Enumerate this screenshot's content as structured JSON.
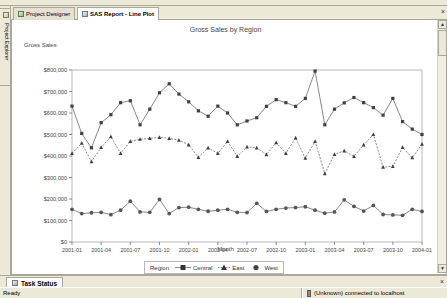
{
  "window": {
    "toolbar_hint": "Project Designer toolbar",
    "close_label": "×"
  },
  "left_dock": {
    "label": "Project Explorer",
    "icon": "project-explorer-icon"
  },
  "tabs": [
    {
      "label": "Project Designer",
      "icon": "project-designer-icon",
      "active": false
    },
    {
      "label": "SAS Report - Line Plot",
      "icon": "report-icon",
      "active": true
    }
  ],
  "bottom_dock": {
    "tab_label": "Task Status",
    "icon": "task-status-icon",
    "close_label": "×"
  },
  "statusbar": {
    "left_text": "Ready",
    "right_text": "(Unknown) connected to localhost",
    "icon": "connection-icon"
  },
  "scrollbar": {
    "up_arrow": "▲",
    "down_arrow": "▼"
  },
  "colors": {
    "marker": "#404040",
    "line": "#555555",
    "axis": "#000000",
    "text": "#444444",
    "panel": "#ece9d8",
    "border": "#aca899"
  },
  "chart_data": {
    "type": "line",
    "title": "Gross Sales by Region",
    "xlabel": "Month",
    "ylabel": "Gross Sales",
    "grid": false,
    "legend_position": "bottom",
    "legend_title": "Region",
    "ylim": [
      0,
      800000
    ],
    "yticks": [
      0,
      100000,
      200000,
      300000,
      400000,
      500000,
      600000,
      700000,
      800000
    ],
    "ytick_labels": [
      "$0",
      "$100,000",
      "$200,000",
      "$300,000",
      "$400,000",
      "$500,000",
      "$600,000",
      "$700,000",
      "$800,000"
    ],
    "xticks": [
      "2001-01",
      "2001-04",
      "2001-07",
      "2001-10",
      "2002-01",
      "2002-04",
      "2002-07",
      "2002-10",
      "2003-01",
      "2003-04",
      "2003-07",
      "2003-10",
      "2004-01"
    ],
    "x": [
      "2001-01",
      "2001-02",
      "2001-03",
      "2001-04",
      "2001-05",
      "2001-06",
      "2001-07",
      "2001-08",
      "2001-09",
      "2001-10",
      "2001-11",
      "2001-12",
      "2002-01",
      "2002-02",
      "2002-03",
      "2002-04",
      "2002-05",
      "2002-06",
      "2002-07",
      "2002-08",
      "2002-09",
      "2002-10",
      "2002-11",
      "2002-12",
      "2003-01",
      "2003-02",
      "2003-03",
      "2003-04",
      "2003-05",
      "2003-06",
      "2003-07",
      "2003-08",
      "2003-09",
      "2003-10",
      "2003-11",
      "2003-12",
      "2004-01"
    ],
    "series": [
      {
        "name": "Central",
        "marker": "square",
        "values": [
          632000,
          505000,
          438000,
          555000,
          592000,
          648000,
          657000,
          545000,
          618000,
          694000,
          736000,
          688000,
          652000,
          610000,
          585000,
          632000,
          600000,
          545000,
          563000,
          578000,
          631000,
          662000,
          648000,
          631000,
          668000,
          795000,
          545000,
          618000,
          647000,
          672000,
          648000,
          625000,
          590000,
          668000,
          560000,
          525000,
          500000
        ]
      },
      {
        "name": "East",
        "marker": "triangle",
        "values": [
          412000,
          460000,
          374000,
          440000,
          490000,
          412000,
          468000,
          478000,
          482000,
          487000,
          482000,
          474000,
          452000,
          394000,
          438000,
          412000,
          468000,
          398000,
          442000,
          438000,
          406000,
          462000,
          412000,
          484000,
          390000,
          468000,
          318000,
          408000,
          424000,
          398000,
          452000,
          500000,
          348000,
          352000,
          440000,
          392000,
          455000
        ]
      },
      {
        "name": "West",
        "marker": "circle",
        "values": [
          152000,
          132000,
          136000,
          138000,
          127000,
          148000,
          190000,
          140000,
          138000,
          198000,
          132000,
          160000,
          162000,
          152000,
          143000,
          148000,
          152000,
          138000,
          137000,
          180000,
          142000,
          152000,
          158000,
          160000,
          164000,
          148000,
          134000,
          140000,
          196000,
          166000,
          144000,
          170000,
          128000,
          126000,
          124000,
          152000,
          142000
        ]
      }
    ]
  }
}
